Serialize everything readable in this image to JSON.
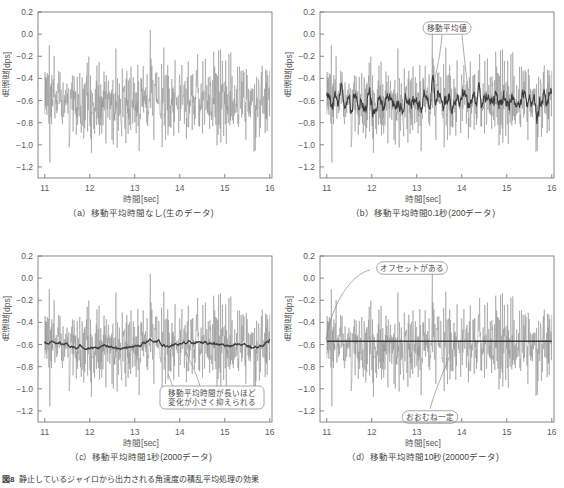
{
  "figure": {
    "caption_number": "図8",
    "caption_text": "静止しているジャイロから出力される角速度の積乱平均処理の効果"
  },
  "axes": {
    "ylabel": "角速度[dps]",
    "xlabel": "時間[sec]",
    "yticks": [
      "0.2",
      "0.0",
      "-0.2",
      "-0.4",
      "-0.6",
      "-0.8",
      "-1.0",
      "-1.2"
    ],
    "ytick_values": [
      0.2,
      0.0,
      -0.2,
      -0.4,
      -0.6,
      -0.8,
      -1.0,
      -1.2
    ],
    "xticks": [
      "11",
      "12",
      "13",
      "14",
      "15",
      "16"
    ],
    "xtick_values": [
      11,
      12,
      13,
      14,
      15,
      16
    ],
    "ylim": [
      -1.3,
      0.2
    ],
    "xlim": [
      10.85,
      16.05
    ]
  },
  "colors": {
    "raw_noise": "#8d8d8d",
    "avg_line": "#3a3a3a",
    "frame": "#7a7a7a",
    "text": "#4a4a4a"
  },
  "panels": [
    {
      "id": "a",
      "label": "（a）",
      "caption": "移動平均時間なし(生のデータ)",
      "avg_window_sec": 0,
      "data_points": 0,
      "annotations": []
    },
    {
      "id": "b",
      "label": "（b）",
      "caption": "移動平均時間0.1秒(200データ)",
      "avg_window_sec": 0.1,
      "data_points": 200,
      "annotations": [
        {
          "text": "移動平均値",
          "x": 138,
          "y": 24
        }
      ]
    },
    {
      "id": "c",
      "label": "（c）",
      "caption": "移動平均時間1秒(2000データ)",
      "avg_window_sec": 1,
      "data_points": 2000,
      "annotations": [
        {
          "text": "移動平均時間が長いほど",
          "x": 210,
          "y": 164
        },
        {
          "text": "変化が小さく抑えられる",
          "x": 210,
          "y": 174
        }
      ]
    },
    {
      "id": "d",
      "label": "（d）",
      "caption": "移動平均時間10秒(20000データ)",
      "avg_window_sec": 10,
      "data_points": 20000,
      "annotations": [
        {
          "text": "オフセットがある",
          "x": 120,
          "y": 22
        },
        {
          "text": "おおむね一定",
          "x": 150,
          "y": 172
        }
      ]
    }
  ],
  "chart_data": {
    "type": "line",
    "xlabel": "時間[sec]",
    "ylabel": "角速度[dps]",
    "xlim": [
      10.85,
      16.05
    ],
    "ylim": [
      -1.3,
      0.2
    ],
    "xticks": [
      11,
      12,
      13,
      14,
      15,
      16
    ],
    "yticks": [
      0.2,
      0.0,
      -0.2,
      -0.4,
      -0.6,
      -0.8,
      -1.0,
      -1.2
    ],
    "grid": false,
    "legend": "none",
    "noise_mean_dps": -0.6,
    "noise_std_dps": 0.18,
    "noise_min_dps": -1.27,
    "noise_max_dps": 0.14,
    "sample_rate_hz": 2000,
    "series": [
      {
        "name": "生データ (raw)",
        "panel": "a",
        "window_sec": 0,
        "mean": -0.6,
        "spread": 0.34,
        "description": "生のジャイロ出力。平均約-0.6 dps、範囲は約-1.27〜+0.14 dps"
      },
      {
        "name": "移動平均0.1秒 (200データ)",
        "panel": "b",
        "window_sec": 0.1,
        "mean": -0.6,
        "spread": 0.09,
        "description": "0.1秒移動平均値。-0.45〜-0.75 dps程度で変動"
      },
      {
        "name": "移動平均1秒 (2000データ)",
        "panel": "c",
        "window_sec": 1,
        "mean": -0.6,
        "spread": 0.03,
        "description": "1秒移動平均値。ほぼ-0.58〜-0.62 dpsに収束"
      },
      {
        "name": "移動平均10秒 (20000データ)",
        "panel": "d",
        "window_sec": 10,
        "mean": -0.57,
        "spread": 0.01,
        "description": "10秒移動平均値。-0.57 dps付近でおおむね一定、オフセットが残る"
      }
    ]
  }
}
